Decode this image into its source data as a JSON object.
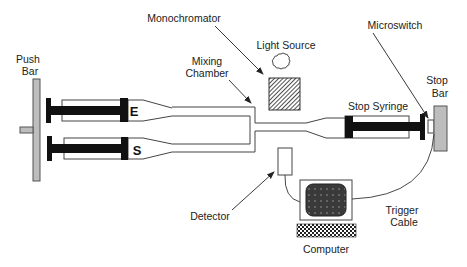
{
  "diagram": {
    "labels": {
      "push_bar_line1": "Push",
      "push_bar_line2": "Bar",
      "monochromator": "Monochromator",
      "light_source": "Light Source",
      "mixing_chamber_line1": "Mixing",
      "mixing_chamber_line2": "Chamber",
      "microswitch": "Microswitch",
      "stop_bar_line1": "Stop",
      "stop_bar_line2": "Bar",
      "stop_syringe": "Stop Syringe",
      "detector": "Detector",
      "trigger_cable_line1": "Trigger",
      "trigger_cable_line2": "Cable",
      "computer": "Computer",
      "syringe_e": "E",
      "syringe_s": "S"
    },
    "colors": {
      "line": "#333333",
      "plunger": "#111111",
      "bar_fill": "#bdbdbd",
      "screen_fill": "#3a3a3a"
    }
  }
}
